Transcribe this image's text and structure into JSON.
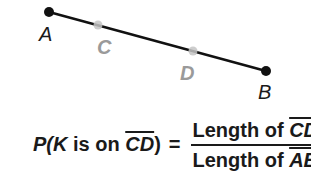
{
  "diagram": {
    "segment": {
      "from": "A",
      "to": "B",
      "color": "#111111"
    },
    "points": [
      {
        "name": "A",
        "x": 49,
        "y": 12,
        "style": "endpoint",
        "color": "#111111"
      },
      {
        "name": "C",
        "x": 98,
        "y": 25,
        "style": "interior",
        "color": "#b5b5b5"
      },
      {
        "name": "D",
        "x": 193,
        "y": 51,
        "style": "interior",
        "color": "#b5b5b5"
      },
      {
        "name": "B",
        "x": 266,
        "y": 71,
        "style": "endpoint",
        "color": "#111111"
      }
    ],
    "labels": {
      "A": "A",
      "C": "C",
      "D": "D",
      "B": "B"
    }
  },
  "formula": {
    "lhs_p": "P(",
    "lhs_k": "K",
    "lhs_mid": " is on ",
    "lhs_seg": "CD",
    "lhs_close": ")",
    "equals": "=",
    "numerator_text": "Length of ",
    "numerator_seg": "CD",
    "denominator_text": "Length of ",
    "denominator_seg": "AB"
  }
}
